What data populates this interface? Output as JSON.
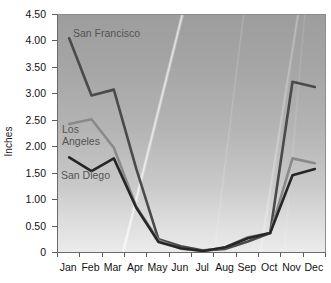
{
  "chart_data": {
    "type": "line",
    "title": "",
    "xlabel": "",
    "ylabel": "Inches",
    "categories": [
      "Jan",
      "Feb",
      "Mar",
      "Apr",
      "May",
      "Jun",
      "Jul",
      "Aug",
      "Sep",
      "Oct",
      "Nov",
      "Dec"
    ],
    "ylim": [
      0,
      4.5
    ],
    "ytick_labels": [
      "4.50",
      "4.00",
      "3.50",
      "3.00",
      "2.50",
      "2.00",
      "1.50",
      "1.00",
      "0.50",
      "0"
    ],
    "ytick_values": [
      4.5,
      4.0,
      3.5,
      3.0,
      2.5,
      2.0,
      1.5,
      1.0,
      0.5,
      0
    ],
    "grid": false,
    "legend_position": "inline-annotations",
    "series": [
      {
        "name": "San Francisco",
        "color": "#4a4a4a",
        "values": [
          4.04,
          2.96,
          3.07,
          1.58,
          0.24,
          0.11,
          0.03,
          0.06,
          0.2,
          0.36,
          3.22,
          3.12
        ]
      },
      {
        "name": "Los Angeles",
        "color": "#8a8a8a",
        "values": [
          2.42,
          2.51,
          1.97,
          0.86,
          0.22,
          0.06,
          0.02,
          0.09,
          0.28,
          0.36,
          1.77,
          1.68
        ]
      },
      {
        "name": "San Diego",
        "color": "#262626",
        "values": [
          1.79,
          1.53,
          1.77,
          0.84,
          0.19,
          0.07,
          0.02,
          0.09,
          0.26,
          0.36,
          1.45,
          1.57
        ]
      }
    ]
  },
  "annotations": {
    "san_francisco": "San Francisco",
    "los_angeles": "Los\nAngeles",
    "san_diego": "San Diego"
  },
  "colors": {
    "san_francisco_line": "#4a4a4a",
    "los_angeles_line": "#8a8a8a",
    "san_diego_line": "#262626",
    "axis": "#6a6a6a",
    "text": "#111111",
    "annotation_text": "#545454"
  }
}
